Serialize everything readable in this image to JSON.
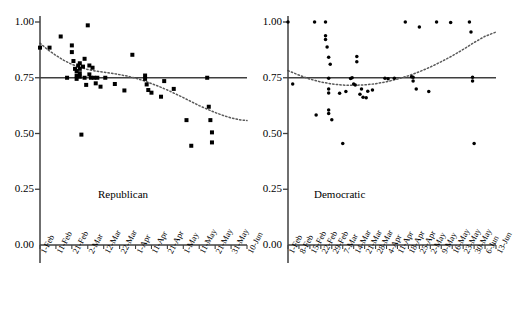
{
  "figure": {
    "background": "#ffffff",
    "marker_color": "#000000",
    "axis_color": "#3f3f3f",
    "reference_line_color": "#3f3f3f",
    "trend_line_color": "#5a5a5a"
  },
  "chart_data": [
    {
      "type": "scatter",
      "title": "Republican",
      "panel_label": "Republican",
      "xlabel": "",
      "ylabel": "",
      "ylim": [
        0.0,
        1.0
      ],
      "ytick_labels": [
        "1.00",
        "0.75",
        "0.50",
        "0.25",
        "0.00"
      ],
      "ytick_values": [
        1.0,
        0.75,
        0.5,
        0.25,
        0.0
      ],
      "grid": false,
      "legend": "none",
      "marker": "square",
      "xtick_labels": [
        "1-Feb",
        "11-Feb",
        "21-Feb",
        "2-Mar",
        "12-Mar",
        "22-Mar",
        "1-Apr",
        "11-Apr",
        "21-Apr",
        "1-May",
        "11-May",
        "21-May",
        "31-May",
        "10-Jun"
      ],
      "xlim_days": [
        0,
        130
      ],
      "xtick_days": [
        0,
        10,
        20,
        30,
        40,
        50,
        60,
        70,
        80,
        90,
        100,
        110,
        120,
        130
      ],
      "reference_line": {
        "y": 0.75,
        "style": "solid"
      },
      "trend_line": {
        "style": "dotted",
        "description": "declining curve from ~0.90 to ~0.56",
        "points": [
          [
            0,
            0.905
          ],
          [
            5,
            0.875
          ],
          [
            10,
            0.85
          ],
          [
            15,
            0.828
          ],
          [
            20,
            0.81
          ],
          [
            25,
            0.797
          ],
          [
            30,
            0.787
          ],
          [
            35,
            0.78
          ],
          [
            40,
            0.775
          ],
          [
            45,
            0.77
          ],
          [
            50,
            0.764
          ],
          [
            55,
            0.757
          ],
          [
            60,
            0.748
          ],
          [
            65,
            0.737
          ],
          [
            70,
            0.724
          ],
          [
            75,
            0.71
          ],
          [
            80,
            0.695
          ],
          [
            85,
            0.678
          ],
          [
            90,
            0.661
          ],
          [
            95,
            0.643
          ],
          [
            100,
            0.625
          ],
          [
            105,
            0.609
          ],
          [
            110,
            0.594
          ],
          [
            115,
            0.581
          ],
          [
            120,
            0.57
          ],
          [
            125,
            0.562
          ],
          [
            130,
            0.558
          ]
        ]
      },
      "points": [
        [
          0,
          0.885
        ],
        [
          6,
          0.885
        ],
        [
          13,
          0.935
        ],
        [
          17,
          0.75
        ],
        [
          20,
          0.895
        ],
        [
          20,
          0.865
        ],
        [
          21,
          0.825
        ],
        [
          22,
          0.79
        ],
        [
          23,
          0.78
        ],
        [
          23,
          0.76
        ],
        [
          23,
          0.745
        ],
        [
          24,
          0.805
        ],
        [
          25,
          0.815
        ],
        [
          25,
          0.79
        ],
        [
          25,
          0.77
        ],
        [
          25,
          0.755
        ],
        [
          26,
          0.495
        ],
        [
          27,
          0.8
        ],
        [
          28,
          0.835
        ],
        [
          28,
          0.75
        ],
        [
          29,
          0.718
        ],
        [
          30,
          0.985
        ],
        [
          31,
          0.805
        ],
        [
          31,
          0.765
        ],
        [
          32,
          0.75
        ],
        [
          33,
          0.795
        ],
        [
          34,
          0.75
        ],
        [
          35,
          0.725
        ],
        [
          36,
          0.75
        ],
        [
          38,
          0.71
        ],
        [
          41,
          0.75
        ],
        [
          47,
          0.722
        ],
        [
          53,
          0.693
        ],
        [
          58,
          0.853
        ],
        [
          66,
          0.76
        ],
        [
          66,
          0.745
        ],
        [
          67,
          0.72
        ],
        [
          68,
          0.695
        ],
        [
          70,
          0.683
        ],
        [
          76,
          0.665
        ],
        [
          78,
          0.735
        ],
        [
          84,
          0.7
        ],
        [
          92,
          0.56
        ],
        [
          95,
          0.445
        ],
        [
          105,
          0.75
        ],
        [
          106,
          0.62
        ],
        [
          107,
          0.56
        ],
        [
          108,
          0.505
        ],
        [
          108,
          0.46
        ]
      ]
    },
    {
      "type": "scatter",
      "title": "Democratic",
      "panel_label": "Democratic",
      "xlabel": "",
      "ylabel": "",
      "ylim": [
        0.0,
        1.0
      ],
      "ytick_labels": [
        "1.00",
        "0.75",
        "0.50",
        "0.25",
        "0.00"
      ],
      "ytick_values": [
        1.0,
        0.75,
        0.5,
        0.25,
        0.0
      ],
      "grid": false,
      "legend": "none",
      "marker": "circle",
      "xtick_labels": [
        "1-Feb",
        "8-Feb",
        "15-Feb",
        "22-Feb",
        "29-Feb",
        "7-Mar",
        "14-Mar",
        "21-Mar",
        "28-Mar",
        "4-Apr",
        "11-Apr",
        "18-Apr",
        "25-Apr",
        "2-May",
        "9-May",
        "16-May",
        "23-May",
        "30-May",
        "6-Jun",
        "13-Jun"
      ],
      "xlim_days": [
        0,
        133
      ],
      "xtick_days": [
        0,
        7,
        14,
        21,
        28,
        35,
        42,
        49,
        56,
        63,
        70,
        77,
        84,
        91,
        98,
        105,
        112,
        119,
        126,
        133
      ],
      "reference_line": {
        "y": 0.75,
        "style": "solid"
      },
      "trend_line": {
        "style": "dotted",
        "description": "U-shaped curve, minimum near mid-March",
        "points": [
          [
            0,
            0.782
          ],
          [
            7,
            0.762
          ],
          [
            14,
            0.744
          ],
          [
            21,
            0.731
          ],
          [
            28,
            0.722
          ],
          [
            35,
            0.717
          ],
          [
            42,
            0.716
          ],
          [
            49,
            0.718
          ],
          [
            56,
            0.723
          ],
          [
            63,
            0.732
          ],
          [
            70,
            0.744
          ],
          [
            77,
            0.759
          ],
          [
            84,
            0.777
          ],
          [
            91,
            0.798
          ],
          [
            98,
            0.822
          ],
          [
            105,
            0.848
          ],
          [
            112,
            0.877
          ],
          [
            119,
            0.908
          ],
          [
            126,
            0.936
          ],
          [
            133,
            0.955
          ]
        ]
      },
      "points": [
        [
          0,
          1.0
        ],
        [
          3,
          0.722
        ],
        [
          17,
          1.0
        ],
        [
          18,
          0.583
        ],
        [
          24,
          1.0
        ],
        [
          24,
          0.938
        ],
        [
          24,
          0.922
        ],
        [
          25,
          0.888
        ],
        [
          26,
          0.842
        ],
        [
          26,
          0.748
        ],
        [
          26,
          0.7
        ],
        [
          26,
          0.682
        ],
        [
          26,
          0.605
        ],
        [
          26,
          0.59
        ],
        [
          27,
          0.81
        ],
        [
          28,
          0.562
        ],
        [
          33,
          0.68
        ],
        [
          35,
          0.455
        ],
        [
          37,
          0.688
        ],
        [
          40,
          0.747
        ],
        [
          41,
          0.75
        ],
        [
          42,
          0.722
        ],
        [
          43,
          0.718
        ],
        [
          44,
          0.845
        ],
        [
          44,
          0.822
        ],
        [
          46,
          0.676
        ],
        [
          47,
          0.7
        ],
        [
          48,
          0.662
        ],
        [
          50,
          0.66
        ],
        [
          51,
          0.69
        ],
        [
          54,
          0.695
        ],
        [
          62,
          0.748
        ],
        [
          64,
          0.745
        ],
        [
          68,
          0.748
        ],
        [
          75,
          1.0
        ],
        [
          79,
          0.755
        ],
        [
          80,
          0.752
        ],
        [
          80,
          0.735
        ],
        [
          82,
          0.7
        ],
        [
          84,
          0.978
        ],
        [
          90,
          0.688
        ],
        [
          95,
          1.0
        ],
        [
          104,
          0.998
        ],
        [
          116,
          1.0
        ],
        [
          117,
          0.955
        ],
        [
          118,
          0.752
        ],
        [
          118,
          0.735
        ],
        [
          119,
          0.455
        ]
      ]
    }
  ]
}
